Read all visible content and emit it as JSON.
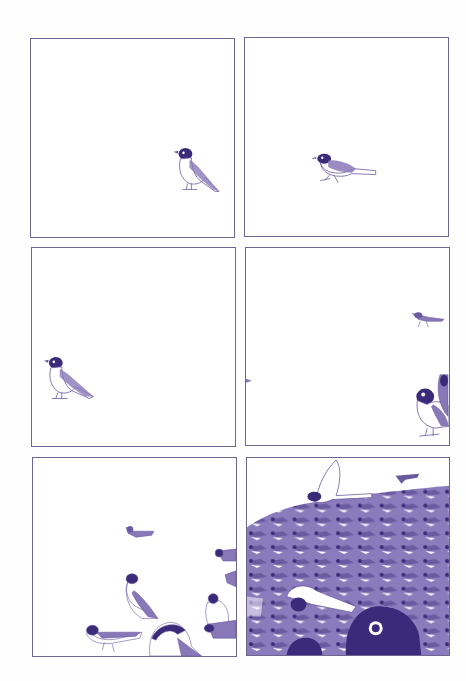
{
  "page": {
    "type": "wordless comic page",
    "layout": "3 rows x 2 columns",
    "colors": {
      "ink_dark": "#3a2a7a",
      "ink_mid": "#6a5aa0",
      "ink_light": "#a89ccc",
      "border": "#6c6690",
      "paper": "#ffffff"
    }
  },
  "panels": [
    {
      "index": 1,
      "description": "Single bird standing, lower right",
      "bird_count": 1
    },
    {
      "index": 2,
      "description": "Single bird hopping, center",
      "bird_count": 1
    },
    {
      "index": 3,
      "description": "Single bird standing, lower left",
      "bird_count": 1
    },
    {
      "index": 4,
      "description": "Birds arriving from right edge",
      "bird_count": 4
    },
    {
      "index": 5,
      "description": "Several birds gathering",
      "bird_count": 8
    },
    {
      "index": 6,
      "description": "Huge dense flock with close-up bird",
      "bird_count": "many"
    }
  ]
}
